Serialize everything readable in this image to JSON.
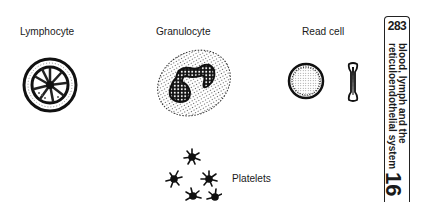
{
  "labels": {
    "lymphocyte": "Lymphocyte",
    "granulocyte": "Granulocyte",
    "red_cell": "Read cell",
    "platelets": "Platelets"
  },
  "side_tab": {
    "page_number": "283",
    "chapter_title_line1": "blood, lymph and the",
    "chapter_title_line2": "reticuloendothelial system",
    "chapter_number": "16"
  }
}
